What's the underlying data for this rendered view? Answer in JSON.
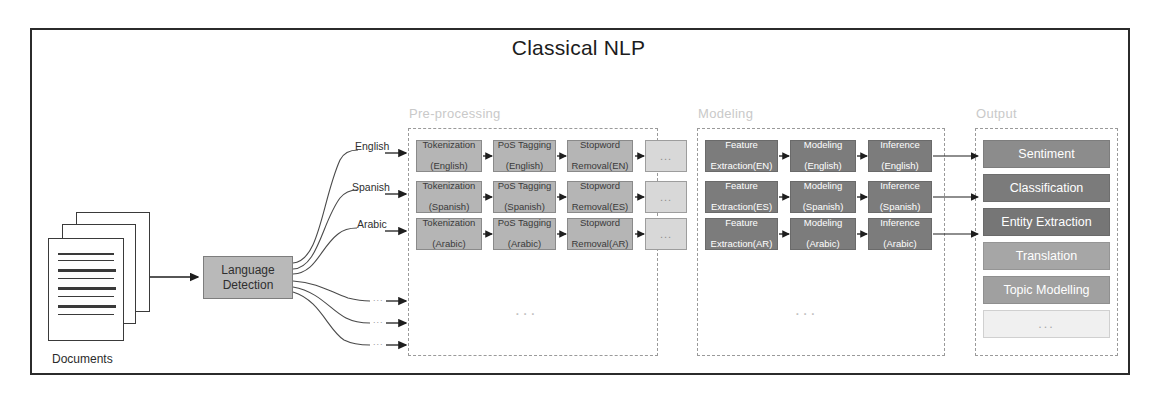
{
  "title": "Classical NLP",
  "source": {
    "documents_label": "Documents",
    "language_detection": "Language\nDetection",
    "language_detection_line1": "Language",
    "language_detection_line2": "Detection"
  },
  "branches": [
    {
      "label": "English"
    },
    {
      "label": "Spanish"
    },
    {
      "label": "Arabic"
    },
    {
      "label": "..."
    },
    {
      "label": "..."
    },
    {
      "label": "..."
    }
  ],
  "groups": {
    "preprocessing": {
      "label": "Pre-processing",
      "vertical_ellipsis": "..."
    },
    "modeling": {
      "label": "Modeling",
      "vertical_ellipsis": "..."
    },
    "output": {
      "label": "Output"
    }
  },
  "preprocessing_rows": [
    {
      "language": "English",
      "steps": [
        {
          "line1": "Tokenization",
          "line2": "(English)",
          "kind": "step"
        },
        {
          "line1": "PoS Tagging",
          "line2": "(English)",
          "kind": "step"
        },
        {
          "line1": "Stopword",
          "line2": "Removal(EN)",
          "kind": "step"
        },
        {
          "line1": "...",
          "line2": "",
          "kind": "ellipsis"
        }
      ]
    },
    {
      "language": "Spanish",
      "steps": [
        {
          "line1": "Tokenization",
          "line2": "(Spanish)",
          "kind": "step"
        },
        {
          "line1": "PoS Tagging",
          "line2": "(Spanish)",
          "kind": "step"
        },
        {
          "line1": "Stopword",
          "line2": "Removal(ES)",
          "kind": "step"
        },
        {
          "line1": "...",
          "line2": "",
          "kind": "ellipsis"
        }
      ]
    },
    {
      "language": "Arabic",
      "steps": [
        {
          "line1": "Tokenization",
          "line2": "(Arabic)",
          "kind": "step"
        },
        {
          "line1": "PoS Tagging",
          "line2": "(Arabic)",
          "kind": "step"
        },
        {
          "line1": "Stopword",
          "line2": "Removal(AR)",
          "kind": "step"
        },
        {
          "line1": "...",
          "line2": "",
          "kind": "ellipsis"
        }
      ]
    }
  ],
  "modeling_rows": [
    {
      "language": "English",
      "steps": [
        {
          "line1": "Feature",
          "line2": "Extraction(EN)"
        },
        {
          "line1": "Modeling",
          "line2": "(English)"
        },
        {
          "line1": "Inference",
          "line2": "(English)"
        }
      ]
    },
    {
      "language": "Spanish",
      "steps": [
        {
          "line1": "Feature",
          "line2": "Extraction(ES)"
        },
        {
          "line1": "Modeling",
          "line2": "(Spanish)"
        },
        {
          "line1": "Inference",
          "line2": "(Spanish)"
        }
      ]
    },
    {
      "language": "Arabic",
      "steps": [
        {
          "line1": "Feature",
          "line2": "Extraction(AR)"
        },
        {
          "line1": "Modeling",
          "line2": "(Arabic)"
        },
        {
          "line1": "Inference",
          "line2": "(Arabic)"
        }
      ]
    }
  ],
  "outputs": [
    {
      "label": "Sentiment",
      "color": "#8c8c8c"
    },
    {
      "label": "Classification",
      "color": "#7b7b7b"
    },
    {
      "label": "Entity Extraction",
      "color": "#767676"
    },
    {
      "label": "Translation",
      "color": "#a6a6a6"
    },
    {
      "label": "Topic Modelling",
      "color": "#a0a0a0"
    },
    {
      "label": "...",
      "color": "#f0f0f0"
    }
  ],
  "colors": {
    "frame": "#2b2b2b",
    "preprocessing_box": "#b5b5b5",
    "modeling_box": "#7c7c7c",
    "group_dash": "#9a9a9a",
    "group_label": "#c9c9c9"
  }
}
